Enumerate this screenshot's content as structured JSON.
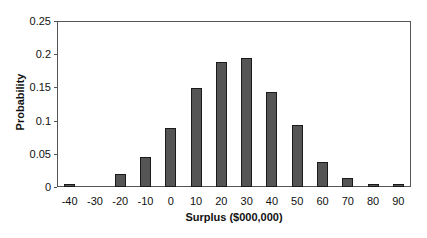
{
  "chart_data": {
    "type": "bar",
    "title": "",
    "xlabel": "Surplus ($000,000)",
    "ylabel": "Probability",
    "categories": [
      "-40",
      "-30",
      "-20",
      "-10",
      "0",
      "10",
      "20",
      "30",
      "40",
      "50",
      "60",
      "70",
      "80",
      "90"
    ],
    "values": [
      0.005,
      0.0,
      0.02,
      0.045,
      0.089,
      0.149,
      0.188,
      0.194,
      0.143,
      0.093,
      0.038,
      0.013,
      0.004,
      0.004
    ],
    "yticks": [
      "0",
      "0.05",
      "0.1",
      "0.15",
      "0.2",
      "0.25"
    ],
    "ylim": [
      0,
      0.25
    ],
    "grid": false,
    "legend": null,
    "colors": {
      "bar_fill": "#555555",
      "bar_border": "#1a1a1a",
      "axis": "#555555"
    }
  }
}
